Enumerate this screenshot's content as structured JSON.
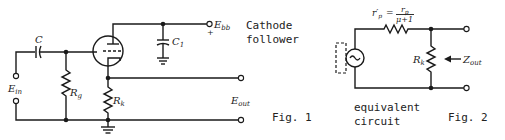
{
  "fig1": {
    "title_line1": "Cathode",
    "title_line2": "follower",
    "caption": "Fig. 1",
    "labels": {
      "capacitor": "C",
      "capacitor_c1": "C",
      "capacitor_c1_sub": "1",
      "supply": "E",
      "supply_sub": "bb",
      "supply_polarity": "+",
      "grid_resistor": "R",
      "grid_resistor_sub": "g",
      "cathode_resistor": "R",
      "cathode_resistor_sub": "k",
      "input": "E",
      "input_sub": "in",
      "output": "E",
      "output_sub": "out"
    }
  },
  "fig2": {
    "caption": "Fig. 2",
    "subtitle_line1": "equivalent",
    "subtitle_line2": "circuit",
    "labels": {
      "rp_prime": "r′",
      "rp_prime_sub": "p",
      "equals": "=",
      "numerator": "r",
      "numerator_sub": "p",
      "denominator": "μ+1",
      "cathode_resistor": "R",
      "cathode_resistor_sub": "k",
      "impedance": "Z",
      "impedance_sub": "out",
      "source_symbol": "~"
    }
  }
}
